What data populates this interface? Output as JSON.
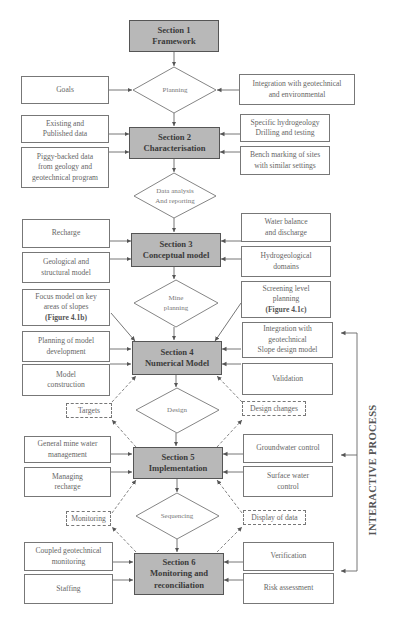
{
  "sections": [
    {
      "id": "s1",
      "line1": "Section 1",
      "line2": "Framework"
    },
    {
      "id": "s2",
      "line1": "Section 2",
      "line2": "Characterisation"
    },
    {
      "id": "s3",
      "line1": "Section 3",
      "line2": "Conceptual model"
    },
    {
      "id": "s4",
      "line1": "Section 4",
      "line2": "Numerical Model"
    },
    {
      "id": "s5",
      "line1": "Section 5",
      "line2": "Implementation"
    },
    {
      "id": "s6",
      "line1": "Section 6",
      "line2": "Monitoring and",
      "line3": "reconciliation"
    }
  ],
  "decisions": [
    {
      "line1": "Planning"
    },
    {
      "line1": "Data analysis",
      "line2": "And reporting"
    },
    {
      "line1": "Mine",
      "line2": "planning"
    },
    {
      "line1": "Design"
    },
    {
      "line1": "Sequencing"
    }
  ],
  "inputs": {
    "goals": "Goals",
    "integration_geo_env": [
      "Integration with geotechnical",
      "and environmental"
    ],
    "existing_data": [
      "Existing and",
      "Published data"
    ],
    "piggy_backed": [
      "Piggy-backed data",
      "from geology and",
      "geotechnical  program"
    ],
    "specific_hydro": [
      "Specific hydrogeology",
      "Drilling and testing"
    ],
    "bench_marking": [
      "Bench marking of sites",
      "with similar settings"
    ],
    "recharge": "Recharge",
    "geological": [
      "Geological and",
      "structural model"
    ],
    "water_balance": [
      "Water balance",
      "and discharge"
    ],
    "hydro_domains": [
      "Hydrogeological",
      "domains"
    ],
    "focus_model": [
      "Focus model on key",
      "areas of slopes",
      "(Figure 4.1b)"
    ],
    "screening": [
      "Screening level",
      "planning",
      "(Figure 4.1c)"
    ],
    "planning_model": [
      "Planning of model",
      "development"
    ],
    "model_construction": [
      "Model",
      "construction"
    ],
    "integration_slope": [
      "Integration with",
      "geotechnical",
      "Slope design model"
    ],
    "validation": "Validation",
    "general_mine_water": [
      "General mine water",
      "management"
    ],
    "managing_recharge": [
      "Managing",
      "recharge"
    ],
    "groundwater_control": "Groundwater control",
    "surface_water": [
      "Surface water",
      "control"
    ],
    "coupled_monitoring": [
      "Coupled geotechnical",
      "monitoring"
    ],
    "staffing": "Staffing",
    "verification": "Verification",
    "risk_assessment": "Risk assessment"
  },
  "feedback": {
    "targets": "Targets",
    "design_changes": "Design changes",
    "monitoring": "Monitoring",
    "display_of_data": "Display of data"
  },
  "side_label": "INTERACTIVE PROCESS",
  "colors": {
    "section_fill": "#b8b8b8",
    "line": "#666666",
    "text": "#555555"
  }
}
